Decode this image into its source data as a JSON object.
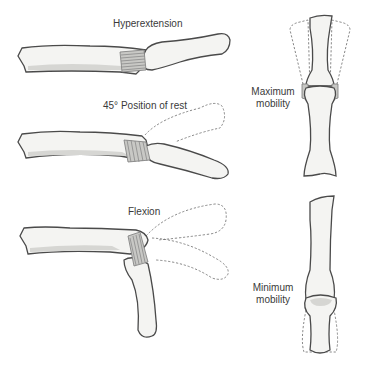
{
  "figure": {
    "panels": [
      {
        "id": "hyperextension",
        "label": "Hyperextension"
      },
      {
        "id": "rest",
        "label": "45° Position of rest"
      },
      {
        "id": "flexion",
        "label": "Flexion"
      },
      {
        "id": "max-mobility",
        "label_line1": "Maximum",
        "label_line2": "mobility"
      },
      {
        "id": "min-mobility",
        "label_line1": "Minimum",
        "label_line2": "mobility"
      }
    ],
    "colors": {
      "bone_fill": "#f4f4f2",
      "bone_outline": "#4a4a4a",
      "ligament": "#8a8a8a",
      "ghost_outline": "#6a6a6a",
      "label_text": "#3a3a3a"
    }
  }
}
